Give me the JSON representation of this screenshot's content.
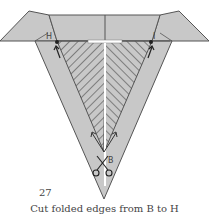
{
  "figure": {
    "step_number": "27",
    "caption": "Cut folded edges from B to H",
    "labels": {
      "left_point": "H",
      "right_point": "I",
      "bottom_point": "B"
    },
    "colors": {
      "paper_fill": "#c8c8c8",
      "outline": "#555555",
      "hatch": "#555555",
      "slit": "#ffffff",
      "text": "#444444"
    },
    "icons": [
      "scissors-icon",
      "arrow-up-icon"
    ]
  }
}
